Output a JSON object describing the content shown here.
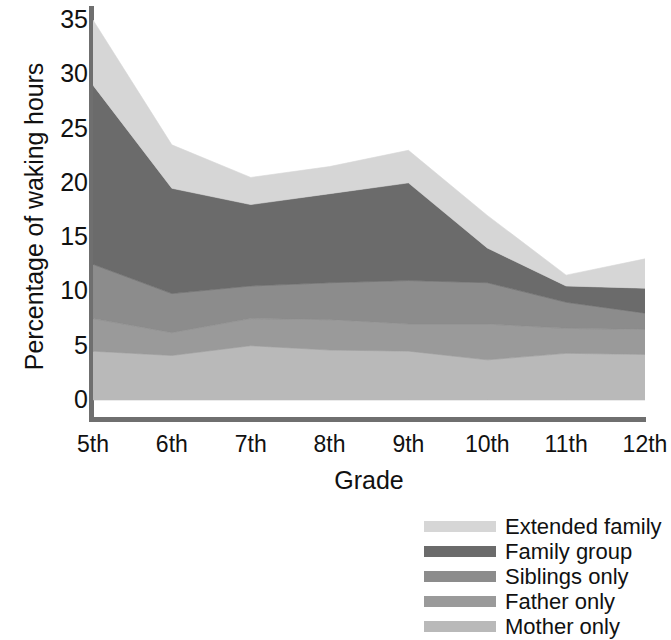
{
  "chart_data": {
    "type": "area",
    "stacked": true,
    "title": "",
    "xlabel": "Grade",
    "ylabel": "Percentage of waking hours",
    "categories": [
      "5th",
      "6th",
      "7th",
      "8th",
      "9th",
      "10th",
      "11th",
      "12th"
    ],
    "x_tick_labels": [
      "5th",
      "6th",
      "7th",
      "8th",
      "9th",
      "10th",
      "11th",
      "12th"
    ],
    "y_tick_labels": [
      "35",
      "30",
      "25",
      "20",
      "15",
      "10",
      "5",
      "0"
    ],
    "y_ticks": [
      35,
      30,
      25,
      20,
      15,
      10,
      5,
      0
    ],
    "ylim": [
      0,
      35
    ],
    "grid": false,
    "legend_position": "bottom-right",
    "series": [
      {
        "name": "Mother only",
        "color": "#b9b9b9",
        "values": [
          4.5,
          4.1,
          5.0,
          4.6,
          4.5,
          3.7,
          4.3,
          4.2
        ]
      },
      {
        "name": "Father only",
        "color": "#9a9a9a",
        "values": [
          3.0,
          2.1,
          2.5,
          2.8,
          2.5,
          3.3,
          2.3,
          2.3
        ]
      },
      {
        "name": "Siblings only",
        "color": "#8c8c8c",
        "values": [
          5.0,
          3.6,
          3.0,
          3.4,
          4.0,
          3.8,
          2.4,
          1.5
        ]
      },
      {
        "name": "Family group",
        "color": "#6b6b6b",
        "values": [
          16.5,
          9.7,
          7.5,
          8.2,
          9.0,
          3.2,
          1.5,
          2.3
        ]
      },
      {
        "name": "Extended family",
        "color": "#d6d6d6",
        "values": [
          6.0,
          4.0,
          2.5,
          2.5,
          3.0,
          3.0,
          1.0,
          2.7
        ]
      }
    ],
    "cumulative_tops": {
      "Mother only": [
        4.5,
        4.1,
        5.0,
        4.6,
        4.5,
        3.7,
        4.3,
        4.2
      ],
      "Father only": [
        7.5,
        6.2,
        7.5,
        7.4,
        7.0,
        7.0,
        6.6,
        6.5
      ],
      "Siblings only": [
        12.5,
        9.8,
        10.5,
        10.8,
        11.0,
        10.8,
        9.0,
        8.0
      ],
      "Family group": [
        29.0,
        19.5,
        18.0,
        19.0,
        20.0,
        14.0,
        10.5,
        10.3
      ],
      "Extended family": [
        35.0,
        23.5,
        20.5,
        21.5,
        23.0,
        17.0,
        11.5,
        13.0
      ]
    }
  },
  "legend": {
    "items": [
      {
        "label": "Extended family",
        "color": "#d6d6d6"
      },
      {
        "label": "Family group",
        "color": "#6b6b6b"
      },
      {
        "label": "Siblings only",
        "color": "#8c8c8c"
      },
      {
        "label": "Father only",
        "color": "#9a9a9a"
      },
      {
        "label": "Mother only",
        "color": "#b9b9b9"
      }
    ]
  },
  "axes": {
    "y_title": "Percentage of waking hours",
    "x_title": "Grade"
  }
}
